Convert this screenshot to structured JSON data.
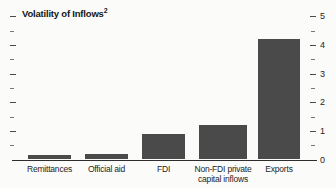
{
  "figure": {
    "title": "Volatility of Inflows",
    "title_superscript": "2"
  },
  "colors": {
    "bar": "#4a4a4a",
    "axis_line": "#2e2e2e",
    "tick": "#4a4a4a",
    "text": "#242424",
    "title_text": "#161616",
    "background": "#fbfbfa"
  },
  "chart_data": {
    "type": "bar",
    "categories": [
      "Remittances",
      "Official aid",
      "FDI",
      "Non-FDI private capital inflows",
      "Exports"
    ],
    "values": [
      0.15,
      0.2,
      0.9,
      1.2,
      4.2
    ],
    "xlabel": "",
    "ylabel": "",
    "ylim": [
      0,
      5
    ],
    "ytick_labels": [
      "0",
      "1",
      "2",
      "3",
      "4",
      "5"
    ],
    "minor_tick_interval": 0.5,
    "grid": false,
    "legend": false,
    "value_axis_side": "right",
    "left_axis_ticks_unlabeled": true
  }
}
